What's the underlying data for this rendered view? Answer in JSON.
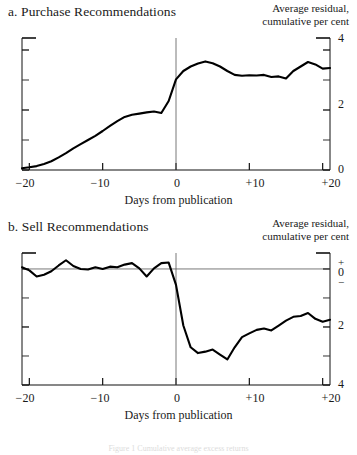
{
  "figure": {
    "footer_caption": "Figure 1  Cumulative average excess returns"
  },
  "panels": [
    {
      "id": "a",
      "title": "a. Purchase Recommendations",
      "axis_caption_line1": "Average residual,",
      "axis_caption_line2": "cumulative per cent",
      "xlabel": "Days from publication",
      "xticks": [
        "−20",
        "−10",
        "0",
        "+10",
        "+20"
      ],
      "yticks": [
        "4",
        "2",
        "0"
      ]
    },
    {
      "id": "b",
      "title": "b. Sell Recommendations",
      "axis_caption_line1": "Average residual,",
      "axis_caption_line2": "cumulative per cent",
      "xlabel": "Days from publication",
      "ytick_plus": "+",
      "ytick_zero": "0",
      "ytick_minus": "−",
      "xticks": [
        "−20",
        "−10",
        "0",
        "+10",
        "+20"
      ],
      "yticks": [
        "2",
        "4"
      ]
    }
  ],
  "chart_data": [
    {
      "type": "line",
      "title": "a. Purchase Recommendations",
      "xlabel": "Days from publication",
      "ylabel": "Average residual, cumulative per cent",
      "xlim": [
        -21,
        21
      ],
      "ylim": [
        0,
        4.4
      ],
      "xticks": [
        -20,
        -10,
        0,
        10,
        20
      ],
      "yticks": [
        0,
        2,
        4
      ],
      "grid": false,
      "event_line_x": 0,
      "x": [
        -21,
        -20,
        -19,
        -18,
        -17,
        -16,
        -15,
        -14,
        -13,
        -12,
        -11,
        -10,
        -9,
        -8,
        -7,
        -6,
        -5,
        -4,
        -3,
        -2,
        -1,
        0,
        1,
        2,
        3,
        4,
        5,
        6,
        7,
        8,
        9,
        10,
        11,
        12,
        13,
        14,
        15,
        16,
        17,
        18,
        19,
        20,
        21
      ],
      "y": [
        0.06,
        0.09,
        0.13,
        0.2,
        0.29,
        0.42,
        0.56,
        0.72,
        0.86,
        1.0,
        1.14,
        1.3,
        1.47,
        1.63,
        1.77,
        1.84,
        1.88,
        1.92,
        1.95,
        1.9,
        2.3,
        3.02,
        3.3,
        3.45,
        3.55,
        3.62,
        3.56,
        3.45,
        3.3,
        3.17,
        3.14,
        3.16,
        3.15,
        3.17,
        3.1,
        3.12,
        3.05,
        3.3,
        3.45,
        3.6,
        3.52,
        3.38,
        3.4
      ]
    },
    {
      "type": "line",
      "title": "b. Sell Recommendations",
      "xlabel": "Days from publication",
      "ylabel": "Average residual, cumulative per cent",
      "xlim": [
        -21,
        21
      ],
      "ylim": [
        -4,
        0.55
      ],
      "xticks": [
        -20,
        -10,
        0,
        10,
        20
      ],
      "yticks": [
        0,
        -2,
        -4
      ],
      "grid": false,
      "event_line_x": 0,
      "zero_line": true,
      "x": [
        -21,
        -20,
        -19,
        -18,
        -17,
        -16,
        -15,
        -14,
        -13,
        -12,
        -11,
        -10,
        -9,
        -8,
        -7,
        -6,
        -5,
        -4,
        -3,
        -2,
        -1,
        0,
        1,
        2,
        3,
        4,
        5,
        6,
        7,
        8,
        9,
        10,
        11,
        12,
        13,
        14,
        15,
        16,
        17,
        18,
        19,
        20,
        21
      ],
      "y": [
        0.06,
        -0.05,
        -0.26,
        -0.2,
        -0.08,
        0.12,
        0.3,
        0.1,
        0.0,
        -0.02,
        0.06,
        0.0,
        0.08,
        0.06,
        0.15,
        0.2,
        0.02,
        -0.26,
        0.02,
        0.2,
        0.22,
        -0.55,
        -1.95,
        -2.7,
        -2.9,
        -2.85,
        -2.78,
        -2.95,
        -3.12,
        -2.7,
        -2.35,
        -2.22,
        -2.1,
        -2.05,
        -2.12,
        -1.95,
        -1.78,
        -1.65,
        -1.62,
        -1.52,
        -1.72,
        -1.82,
        -1.75
      ]
    }
  ]
}
